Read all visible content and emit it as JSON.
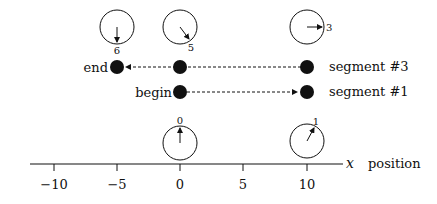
{
  "diagram": {
    "type": "spacetime-position-diagram",
    "axis": {
      "variable_label": "x",
      "name_label": "position",
      "ticks": [
        {
          "value": -10,
          "label": "−10"
        },
        {
          "value": -5,
          "label": "−5"
        },
        {
          "value": 0,
          "label": "0"
        },
        {
          "value": 5,
          "label": "5"
        },
        {
          "value": 10,
          "label": "10"
        }
      ]
    },
    "clocks": {
      "top": [
        {
          "x": -5,
          "reading": "6",
          "hand_angle_deg": 180
        },
        {
          "x": 0,
          "reading": "5",
          "hand_angle_deg": 140
        },
        {
          "x": 10,
          "reading": "3",
          "hand_angle_deg": 90
        }
      ],
      "bottom": [
        {
          "x": 0,
          "reading": "0",
          "hand_angle_deg": 0
        },
        {
          "x": 10,
          "reading": "1",
          "hand_angle_deg": 30
        }
      ]
    },
    "segments": [
      {
        "label": "segment #3",
        "start_label": "",
        "end_label": "end",
        "points_x": [
          10,
          0,
          -5
        ],
        "direction": "left"
      },
      {
        "label": "segment #1",
        "start_label": "begin",
        "end_label": "",
        "points_x": [
          0,
          10
        ],
        "direction": "right"
      }
    ],
    "colors": {
      "ink": "#111111",
      "background": "#ffffff"
    }
  }
}
